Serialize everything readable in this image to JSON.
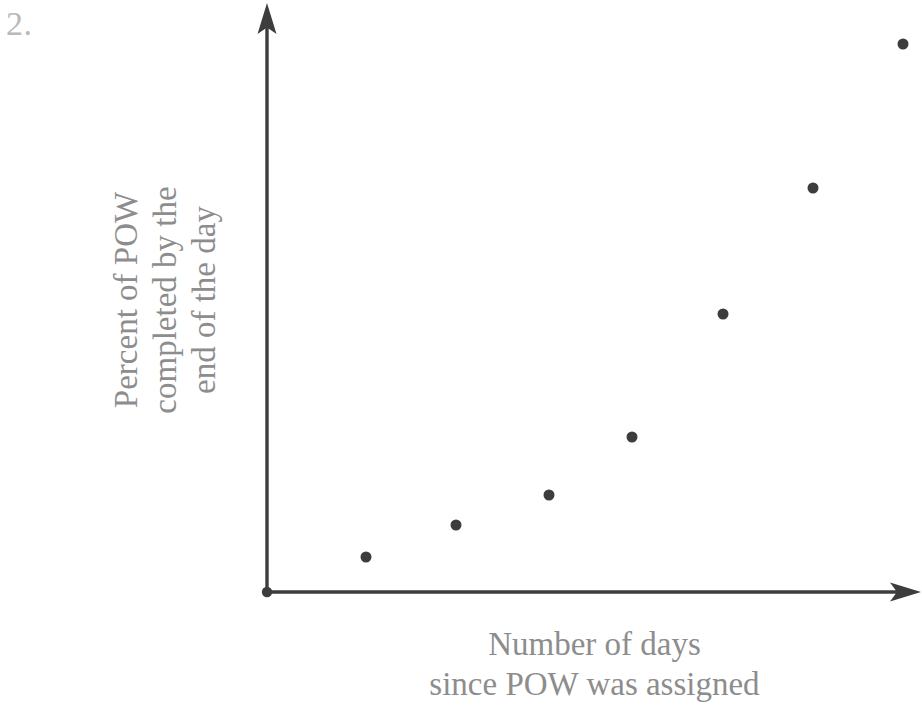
{
  "problem": {
    "number_label": "2."
  },
  "chart_data": {
    "type": "scatter",
    "title": "",
    "xlabel": "Number of days since POW was assigned",
    "ylabel": "Percent of POW completed by the end of the day",
    "xlabel_lines": [
      "Number of days",
      "since POW was assigned"
    ],
    "ylabel_lines": [
      "Percent of POW",
      "completed by the",
      "end of the day"
    ],
    "grid": false,
    "legend": null,
    "axis_ticks": {
      "x": [],
      "y": []
    },
    "xlim": [
      0,
      10
    ],
    "ylim": [
      0,
      100
    ],
    "x": [
      1.55,
      2.95,
      4.4,
      5.7,
      7.1,
      8.5,
      9.9
    ],
    "y": [
      6.0,
      11.5,
      16.7,
      26.7,
      47.9,
      69.7,
      94.5
    ],
    "point_color": "#3d3d3d",
    "point_diameter_px": 11,
    "points_pixel": [
      {
        "cx": 366,
        "cy": 557
      },
      {
        "cx": 456,
        "cy": 525
      },
      {
        "cx": 549,
        "cy": 495
      },
      {
        "cx": 632,
        "cy": 437
      },
      {
        "cx": 723,
        "cy": 314
      },
      {
        "cx": 813,
        "cy": 188
      },
      {
        "cx": 903,
        "cy": 44
      }
    ]
  },
  "style": {
    "axis_color": "#3d3d3d",
    "label_color": "#8d8d8d",
    "number_color": "#b9b9b9",
    "background": "#ffffff"
  }
}
